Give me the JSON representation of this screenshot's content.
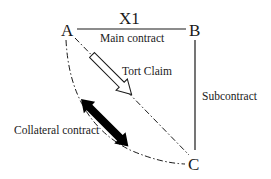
{
  "diagram": {
    "title": "X1",
    "nodes": {
      "a": "A",
      "b": "B",
      "c": "C"
    },
    "edges": {
      "main_contract": "Main contract",
      "subcontract": "Subcontract",
      "tort_claim": "Tort Claim",
      "collateral_contract": "Collateral contract"
    },
    "colors": {
      "stroke": "#1a1a1a",
      "arrow_fill_solid": "#000000",
      "arrow_fill_hollow": "#ffffff",
      "background": "#ffffff"
    }
  }
}
